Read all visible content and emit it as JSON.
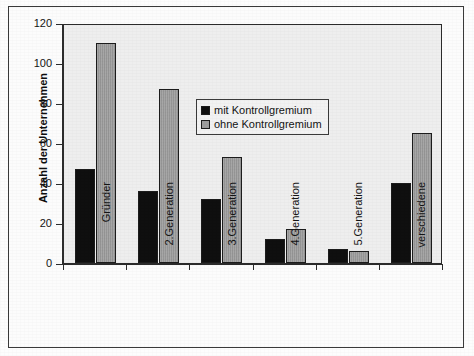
{
  "chart_data": {
    "type": "bar",
    "title": "",
    "xlabel": "",
    "ylabel": "Anzahl der Unternehmen",
    "ylim": [
      0,
      120
    ],
    "ytick_step": 20,
    "yticks": [
      0,
      20,
      40,
      60,
      80,
      100,
      120
    ],
    "ytick_labels": [
      "0",
      "20",
      "40",
      "60",
      "80",
      "100",
      "120"
    ],
    "grid": false,
    "legend_position": "upper center",
    "categories": [
      "Gründer",
      "2.Generation",
      "3.Generation",
      "4.Generation",
      "5.Generation",
      "verschiedene"
    ],
    "series": [
      {
        "name": "mit Kontrollgremium",
        "color": "#0f0f0f",
        "values": [
          47,
          36,
          32,
          12,
          7,
          40
        ]
      },
      {
        "name": "ohne Kontrollgremium",
        "color": "#9d9d9d",
        "values": [
          110,
          87,
          53,
          17,
          6,
          65
        ]
      }
    ]
  },
  "legend": {
    "items": [
      {
        "label": "mit Kontrollgremium"
      },
      {
        "label": "ohne Kontrollgremium"
      }
    ]
  }
}
